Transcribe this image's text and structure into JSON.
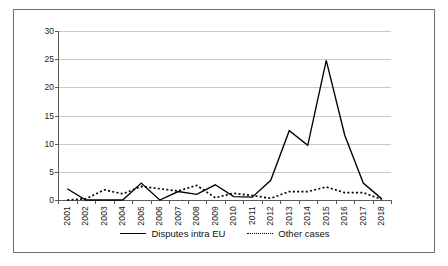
{
  "chart_data": {
    "type": "line",
    "title": "",
    "subtitle": "",
    "xlabel": "",
    "ylabel": "",
    "ylim": [
      0,
      30
    ],
    "yticks": [
      0,
      5,
      10,
      15,
      20,
      25,
      30
    ],
    "grid": true,
    "legend_position": "bottom",
    "categories": [
      "2001",
      "2002",
      "2003",
      "2004",
      "2005",
      "2006",
      "2007",
      "2008",
      "2009",
      "2010",
      "2011",
      "2012",
      "2013",
      "2014",
      "2015",
      "2016",
      "2017",
      "2018"
    ],
    "series": [
      {
        "name": "Disputes intra EU",
        "style": "solid",
        "color": "#000000",
        "values": [
          2,
          0,
          0,
          0,
          3,
          0,
          1.5,
          1,
          2.7,
          0.6,
          0.5,
          3.5,
          12.3,
          9.7,
          24.8,
          11.5,
          3,
          0.2
        ]
      },
      {
        "name": "Other cases",
        "style": "dotted",
        "color": "#000000",
        "values": [
          0,
          0.2,
          1.8,
          1.1,
          2.4,
          2,
          1.6,
          2.6,
          0.4,
          1.2,
          0.8,
          0.3,
          1.5,
          1.5,
          2.3,
          1.3,
          1.3,
          0.1
        ]
      }
    ]
  },
  "legend": {
    "entries": [
      {
        "label": "Disputes intra EU",
        "swatch": "solid-line-swatch"
      },
      {
        "label": "Other cases",
        "swatch": "dotted-line-swatch"
      }
    ]
  },
  "axes": {
    "y_tick_labels": [
      "30",
      "25",
      "20",
      "15",
      "10",
      "5",
      "0"
    ],
    "x_tick_labels": [
      "2001",
      "2002",
      "2003",
      "2004",
      "2005",
      "2006",
      "2007",
      "2008",
      "2009",
      "2010",
      "2011",
      "2012",
      "2013",
      "2014",
      "2015",
      "2016",
      "2017",
      "2018"
    ]
  },
  "colors": {
    "series_line": "#000000",
    "gridline": "#c9c9c9",
    "axis": "#5a5a5a",
    "frame_border": "#6e6e6e",
    "background": "#ffffff",
    "text": "#1a1a1a"
  }
}
